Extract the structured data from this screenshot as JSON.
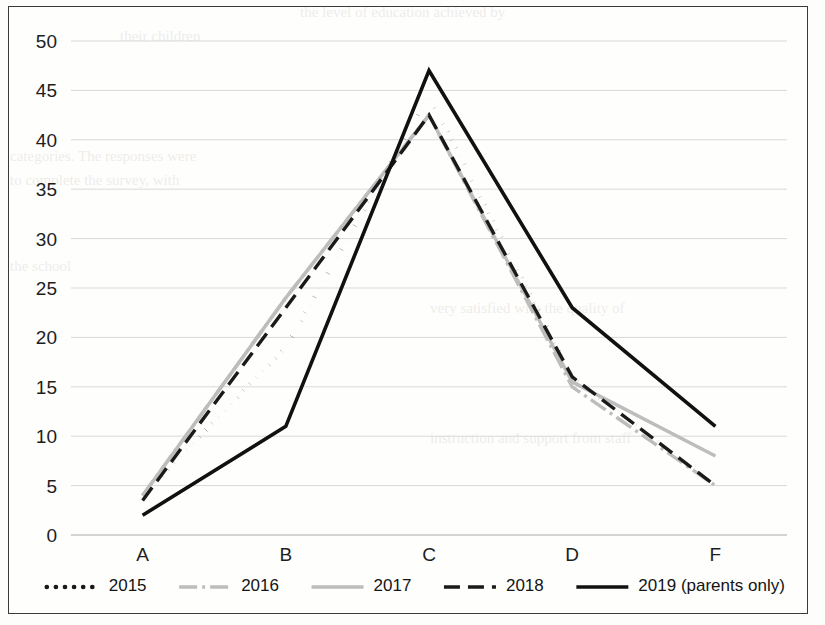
{
  "chart_data": {
    "type": "line",
    "title": "",
    "xlabel": "",
    "ylabel": "",
    "categories": [
      "A",
      "B",
      "C",
      "D",
      "F"
    ],
    "ylim": [
      0,
      50
    ],
    "ytick_values": [
      0,
      5,
      10,
      15,
      20,
      25,
      30,
      35,
      40,
      45,
      50
    ],
    "ytick_labels": [
      "0",
      "5",
      "10",
      "15",
      "20",
      "25",
      "30",
      "35",
      "40",
      "45",
      "50"
    ],
    "grid": true,
    "legend_position": "bottom",
    "series": [
      {
        "name": "2015",
        "values": [
          4,
          19,
          44.5,
          16,
          5
        ],
        "color": "#1a1a1a",
        "style": "dotted",
        "dasharray": "0.1,9",
        "width": 4.6,
        "linecap": "round"
      },
      {
        "name": "2016",
        "values": [
          4,
          24,
          42.5,
          15,
          5
        ],
        "color": "#bdbdbd",
        "style": "dash-dot",
        "dasharray": "18,5,3,5",
        "width": 3.4,
        "linecap": "butt"
      },
      {
        "name": "2017",
        "values": [
          4,
          24,
          42.5,
          15.5,
          8
        ],
        "color": "#bdbdbd",
        "style": "solid",
        "dasharray": "",
        "width": 3.4,
        "linecap": "butt"
      },
      {
        "name": "2018",
        "values": [
          3.5,
          23,
          42.5,
          16,
          5
        ],
        "color": "#1a1a1a",
        "style": "dashed",
        "dasharray": "16,8",
        "width": 3.4,
        "linecap": "butt"
      },
      {
        "name": "2019 (parents only)",
        "values": [
          2,
          11,
          47,
          23,
          11
        ],
        "color": "#111111",
        "style": "solid",
        "dasharray": "",
        "width": 3.6,
        "linecap": "butt"
      }
    ]
  },
  "legend": {
    "entries": [
      {
        "label": "2015"
      },
      {
        "label": "2016"
      },
      {
        "label": "2017"
      },
      {
        "label": "2018"
      },
      {
        "label": "2019 (parents only)"
      }
    ]
  },
  "background_text": {
    "lines": [
      "the level of education achieved by",
      "their children",
      "categories.  The responses were",
      "to complete the survey, with",
      "the school",
      "very satisfied with the quality of",
      "instruction and support from staff"
    ]
  }
}
